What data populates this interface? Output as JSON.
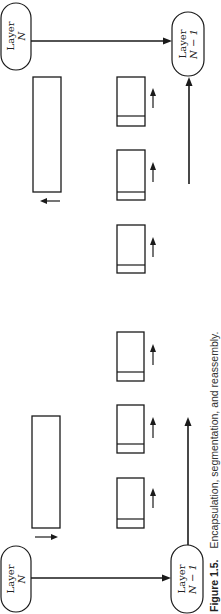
{
  "figure": {
    "caption_label": "Figure 1.5.",
    "caption_text": "Encapsulation, segmentation, and reassembly."
  },
  "nodes": {
    "sender_top": {
      "line1": "Layer",
      "line2": "N"
    },
    "receiver_top": {
      "line1": "Layer",
      "line2": "N − 1"
    },
    "sender_bottom": {
      "line1": "Layer",
      "line2": "N − 1"
    },
    "receiver_bottom": {
      "line1": "Layer",
      "line2": "N"
    }
  },
  "colors": {
    "ink": "#1a1a1a",
    "background": "#ffffff"
  }
}
